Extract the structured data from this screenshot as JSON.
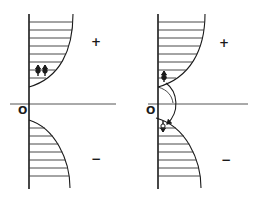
{
  "diagram": {
    "colors": {
      "ink": "#1a1a1a",
      "background": "#ffffff",
      "axis_light": "#555555"
    },
    "panels": [
      {
        "id": "left",
        "origin_label": "O",
        "upper_sign": "+",
        "lower_sign": "−",
        "dipoles": 2,
        "transfer_arrow": false
      },
      {
        "id": "right",
        "origin_label": "O",
        "upper_sign": "+",
        "lower_sign": "−",
        "dipoles": 2,
        "transfer_arrow": true
      }
    ]
  }
}
